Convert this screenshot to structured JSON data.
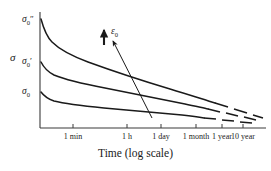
{
  "chart_data": {
    "type": "line",
    "title": "",
    "xlabel": "Time (log scale)",
    "ylabel": "σ",
    "x_scale": "log",
    "grid": false,
    "legend": null,
    "x_tick_labels": [
      "1 min",
      "1 h",
      "1 day",
      "1 month",
      "1 year",
      "10 year"
    ],
    "x_tick_positions": [
      73,
      127,
      161,
      196,
      222,
      243
    ],
    "y_tick_labels": [
      {
        "symbol": "σ",
        "subscript": "0",
        "prime": "″",
        "text": "σ₀″",
        "y": 20
      },
      {
        "symbol": "σ",
        "subscript": "0",
        "prime": "′",
        "text": "σ₀′",
        "y": 62
      },
      {
        "symbol": "σ",
        "subscript": "0",
        "prime": "",
        "text": "σ₀",
        "y": 92
      }
    ],
    "annotation": {
      "label": "ε",
      "label_subscript": "0",
      "label_text": "ε₀",
      "meaning": "increasing applied strain"
    },
    "series": [
      {
        "name": "σ₀″",
        "comment": "highest initial stress relaxation curve",
        "solid_path": "M 41,19 C 44,30 47,37 52,42 C 60,50 72,56 88,62 C 110,70 140,80 170,89 C 190,95 205,100 215,103",
        "dash_path": "M 215,103 L 228,107 M 234,109 L 247,113 M 253,115 L 263,118",
        "points": [
          {
            "x": 41,
            "y": 19
          },
          {
            "x": 52,
            "y": 42
          },
          {
            "x": 88,
            "y": 62
          },
          {
            "x": 140,
            "y": 80
          },
          {
            "x": 215,
            "y": 103
          },
          {
            "x": 263,
            "y": 118
          }
        ]
      },
      {
        "name": "σ₀′",
        "comment": "middle initial stress relaxation curve",
        "solid_path": "M 41,62 C 44,68 48,72 54,75 C 66,80 84,84 105,88 C 130,93 160,99 185,104 C 195,106 203,108 208,109",
        "dash_path": "M 208,109 L 220,112 M 226,113 L 238,116 M 244,117 L 256,120",
        "points": [
          {
            "x": 41,
            "y": 62
          },
          {
            "x": 54,
            "y": 75
          },
          {
            "x": 105,
            "y": 88
          },
          {
            "x": 160,
            "y": 99
          },
          {
            "x": 208,
            "y": 109
          },
          {
            "x": 256,
            "y": 120
          }
        ]
      },
      {
        "name": "σ₀",
        "comment": "lowest initial stress relaxation curve",
        "solid_path": "M 41,92 C 44,96 48,99 54,101 C 66,104 84,106 104,108 C 128,110 158,113 182,115 C 192,116 199,117 204,118",
        "dash_path": "M 204,118 L 216,119 M 222,120 L 234,121 M 240,122 L 252,123",
        "points": [
          {
            "x": 41,
            "y": 92
          },
          {
            "x": 54,
            "y": 101
          },
          {
            "x": 104,
            "y": 108
          },
          {
            "x": 158,
            "y": 113
          },
          {
            "x": 204,
            "y": 118
          },
          {
            "x": 252,
            "y": 123
          }
        ]
      }
    ],
    "axes": {
      "x_axis": {
        "x1": 40,
        "y1": 128,
        "x2": 266,
        "y2": 128
      },
      "y_axis": {
        "x1": 40,
        "y1": 12,
        "x2": 40,
        "y2": 128
      }
    },
    "arrows": {
      "diagonal": {
        "x1": 152,
        "y1": 118,
        "x2": 111,
        "y2": 39,
        "direction": "up-left"
      },
      "vertical": {
        "x1": 104,
        "y1": 44,
        "x2": 104,
        "y2": 28,
        "direction": "up"
      }
    }
  }
}
